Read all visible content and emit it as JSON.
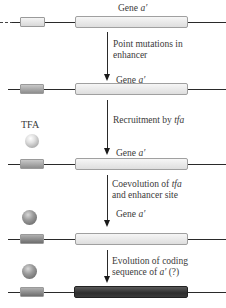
{
  "figure": {
    "stages": [
      {
        "gene_label": "Gene",
        "gene_symbol": "a′",
        "enhancer_state": "original",
        "tfa_bound": false,
        "coding_state": "original"
      },
      {
        "gene_label": "Gene",
        "gene_symbol": "a′",
        "enhancer_state": "mutated",
        "tfa_bound": false,
        "coding_state": "original"
      },
      {
        "gene_label": "Gene",
        "gene_symbol": "a′",
        "enhancer_state": "mutated",
        "tfa_bound": true,
        "tfa_label": "TFA",
        "coding_state": "original"
      },
      {
        "gene_label": "Gene",
        "gene_symbol": "a′",
        "enhancer_state": "coevolved",
        "tfa_bound": true,
        "coding_state": "original"
      },
      {
        "enhancer_state": "coevolved",
        "tfa_bound": true,
        "coding_state": "evolved"
      }
    ],
    "transitions": [
      {
        "line1": "Point mutations in",
        "line2": "enhancer"
      },
      {
        "line1_prefix": "Recruitment by ",
        "line1_italic": "tfa"
      },
      {
        "line1_prefix": "Coevolution of ",
        "line1_italic": "tfa",
        "line2": "and enhancer site"
      },
      {
        "line1": "Evolution of coding",
        "line2_prefix": "sequence of ",
        "line2_italic": "a′",
        "line2_suffix": " (?)"
      }
    ],
    "tfa_label": "TFA"
  },
  "colors": {
    "dna_line": "#2a2a2a",
    "enhancer_original": "#e4e4e4",
    "enhancer_mutated": "#a9a9a9",
    "enhancer_coevolved": "#8a8a8a",
    "gene_original": "#ededed",
    "gene_evolved": "#3e3e3e",
    "tfa_light": "#d6d6d6",
    "tfa_dark": "#7a7a7a"
  }
}
